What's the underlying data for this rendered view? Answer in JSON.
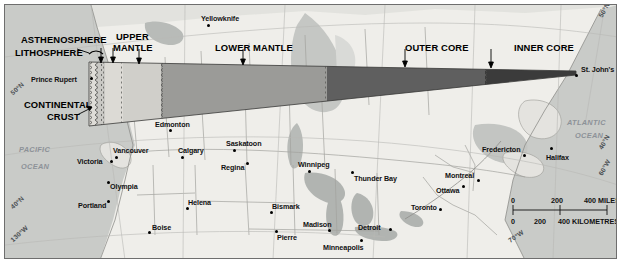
{
  "figure": {
    "type": "cross-section-map"
  },
  "annotations": [
    {
      "id": "asthenosphere",
      "label": "ASTHENOSPHERE"
    },
    {
      "id": "lithosphere",
      "label": "LITHOSPHERE"
    },
    {
      "id": "upper_mantle",
      "label": "UPPER\nMANTLE",
      "line1": "UPPER",
      "line2": "MANTLE"
    },
    {
      "id": "lower_mantle",
      "label": "LOWER MANTLE"
    },
    {
      "id": "outer_core",
      "label": "OUTER CORE"
    },
    {
      "id": "inner_core",
      "label": "INNER CORE"
    },
    {
      "id": "continental_crust",
      "label": "CONTINENTAL\nCRUST",
      "line1": "CONTINENTAL",
      "line2": "CRUST"
    }
  ],
  "oceans": [
    {
      "name": "PACIFIC",
      "line2": "OCEAN"
    },
    {
      "name": "ATLANTIC",
      "line2": "OCEAN"
    }
  ],
  "cities": [
    {
      "name": "Yellowknife"
    },
    {
      "name": "Prince Rupert"
    },
    {
      "name": "St. John's"
    },
    {
      "name": "Edmonton"
    },
    {
      "name": "Vancouver"
    },
    {
      "name": "Victoria"
    },
    {
      "name": "Calgary"
    },
    {
      "name": "Saskatoon"
    },
    {
      "name": "Regina"
    },
    {
      "name": "Winnipeg"
    },
    {
      "name": "Thunder Bay"
    },
    {
      "name": "Fredericton"
    },
    {
      "name": "Halifax"
    },
    {
      "name": "Montreal"
    },
    {
      "name": "Ottawa"
    },
    {
      "name": "Toronto"
    },
    {
      "name": "Detroit"
    },
    {
      "name": "Olympia"
    },
    {
      "name": "Portland"
    },
    {
      "name": "Helena"
    },
    {
      "name": "Boise"
    },
    {
      "name": "Bismark"
    },
    {
      "name": "Madison"
    },
    {
      "name": "Pierre"
    },
    {
      "name": "Minneapolis"
    }
  ],
  "graticule": [
    {
      "label": "50°N",
      "id": "lat50n-left"
    },
    {
      "label": "40°N",
      "id": "lat40n-left"
    },
    {
      "label": "130°W",
      "id": "lon130w"
    },
    {
      "label": "50°N",
      "id": "lat50n-right"
    },
    {
      "label": "40°N",
      "id": "lat40n-right"
    },
    {
      "label": "60°W",
      "id": "lon60w"
    },
    {
      "label": "70°W",
      "id": "lon70w"
    }
  ],
  "scale_bar": {
    "miles": {
      "ticks": [
        "0",
        "200",
        "400"
      ],
      "unit": "MILES",
      "top_label_0": "0",
      "top_label_200": "200",
      "top_label_400": "400 MILES"
    },
    "kilometres": {
      "ticks": [
        "0",
        "200",
        "400"
      ],
      "unit": "KILOMETRES",
      "bottom_label_0": "0",
      "bottom_label_200": "200",
      "bottom_label_400": "400 KILOMETRES"
    }
  },
  "colors": {
    "land": "#e9e8e4",
    "ocean": "#c9cbc8",
    "border": "#9a9a96",
    "crust": "#e3e2de",
    "lithosphere": "#cdccc8",
    "asthenosphere": "#dedcd7",
    "upper_mantle": "#d2d1cc",
    "lower_mantle": "#9a9a97",
    "outer_core": "#5e5e5e",
    "inner_core": "#3a3a3a",
    "text": "#111111",
    "geo_text": "#8d9298"
  }
}
